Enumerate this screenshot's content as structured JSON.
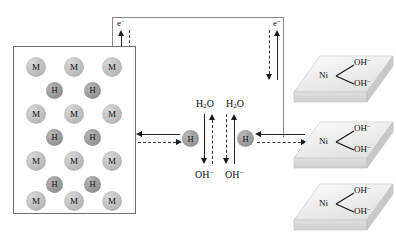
{
  "diagram": {
    "colors": {
      "metal_atom": "#c3c3c3",
      "hydrogen_atom": "#9e9e9e",
      "slab_face": "#efefef",
      "slab_side": "#d2d2d2",
      "line": "#222222",
      "box_border": "#6f6f6f"
    }
  },
  "electrode_left": {
    "name": "metal hydride lattice",
    "rows": [
      {
        "type": "M",
        "labels": [
          "M",
          "M",
          "M"
        ]
      },
      {
        "type": "H",
        "labels": [
          "H",
          "H"
        ]
      },
      {
        "type": "M",
        "labels": [
          "M",
          "M",
          "M"
        ]
      },
      {
        "type": "H",
        "labels": [
          "H",
          "H"
        ]
      },
      {
        "type": "M",
        "labels": [
          "M",
          "M",
          "M"
        ]
      },
      {
        "type": "H",
        "labels": [
          "H",
          "H"
        ]
      },
      {
        "type": "M",
        "labels": [
          "M",
          "M",
          "M"
        ]
      }
    ],
    "metal_label": "M",
    "hydrogen_label": "H"
  },
  "circuit": {
    "electron_label_left": "e",
    "electron_charge_left": "−",
    "electron_label_right": "e",
    "electron_charge_right": "−"
  },
  "electrolyte": {
    "hydrogen_left_label": "H",
    "hydrogen_right_label": "H",
    "water_left": "H",
    "water_left_sub": "2",
    "water_left_rest": "O",
    "water_right": "H",
    "water_right_sub": "2",
    "water_right_rest": "O",
    "hydroxide_left": "OH",
    "hydroxide_left_charge": "−",
    "hydroxide_right": "OH",
    "hydroxide_right_charge": "−"
  },
  "electrode_right": {
    "name": "nickel hydroxide slabs",
    "slabs": [
      {
        "metal": "Ni",
        "ligand_top": "OH",
        "ligand_top_charge": "−",
        "ligand_bottom": "OH",
        "ligand_bottom_charge": "−"
      },
      {
        "metal": "Ni",
        "ligand_top": "OH",
        "ligand_top_charge": "−",
        "ligand_bottom": "OH",
        "ligand_bottom_charge": "−"
      },
      {
        "metal": "Ni",
        "ligand_top": "OH",
        "ligand_top_charge": "−",
        "ligand_bottom": "OH",
        "ligand_bottom_charge": "−"
      }
    ]
  }
}
